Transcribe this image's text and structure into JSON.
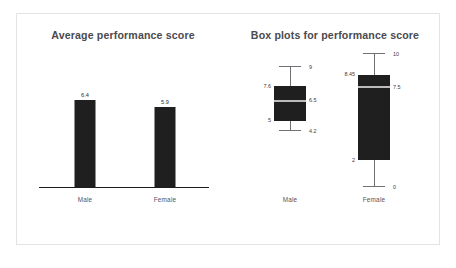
{
  "figure": {
    "background": "#ffffff",
    "frame_color": "#e3e3e5",
    "bar_color": "#1f1f20",
    "title_color": "#4a4a4f"
  },
  "panels": {
    "bar": {
      "title": "Average performance score"
    },
    "box": {
      "title": "Box plots for performance score"
    }
  },
  "chart_data": [
    {
      "type": "bar",
      "title": "Average performance score",
      "xlabel": "",
      "ylabel": "",
      "categories": [
        "Male",
        "Female"
      ],
      "values": [
        6.4,
        5.9
      ],
      "value_labels": [
        "6.4",
        "5.9"
      ],
      "ylim": [
        0,
        7.2
      ],
      "grid": false,
      "legend": "none",
      "bar_color": "#1f1f20"
    },
    {
      "type": "box",
      "title": "Box plots for performance score",
      "xlabel": "",
      "ylabel": "",
      "categories": [
        "Male",
        "Female"
      ],
      "ylim": [
        0,
        10
      ],
      "grid": false,
      "legend": "none",
      "boxes": [
        {
          "name": "Male",
          "whisker_high": 9,
          "q3": 7.6,
          "median": 6.5,
          "q1": 5,
          "whisker_low": 4.2,
          "labels": {
            "whisker_high": "9",
            "q3": "7.6",
            "median": "6.5",
            "q1": "5",
            "whisker_low": "4.2"
          }
        },
        {
          "name": "Female",
          "whisker_high": 10,
          "q3": 8.45,
          "median": 7.5,
          "q1": 2,
          "whisker_low": 0,
          "labels": {
            "whisker_high": "10",
            "q3": "8.45",
            "median": "7.5",
            "q1": "2",
            "whisker_low": "0"
          }
        }
      ]
    }
  ]
}
